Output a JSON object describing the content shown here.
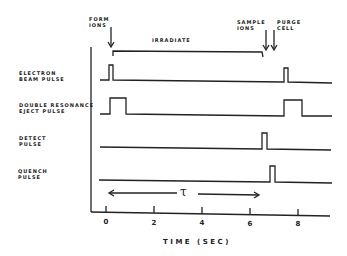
{
  "diagram": {
    "x_axis": {
      "label": "TIME (SEC)",
      "ticks": [
        "0",
        "2",
        "4",
        "6",
        "8"
      ]
    },
    "annotations": {
      "form_ions": "FORM\nIONS",
      "irradiate": "IRRADIATE",
      "sample_ions": "SAMPLE\nIONS",
      "purge_cell": "PURGE\nCELL",
      "tau": "τ"
    },
    "channels": [
      {
        "label": "ELECTRON\nBEAM PULSE",
        "pulses": [
          [
            0.1,
            0.35
          ],
          [
            7.4,
            7.6
          ]
        ]
      },
      {
        "label": "DOUBLE RESONANCE\nEJECT PULSE",
        "pulses": [
          [
            0.1,
            0.8
          ],
          [
            7.4,
            8.0
          ]
        ]
      },
      {
        "label": "DETECT\nPULSE",
        "pulses": [
          [
            6.6,
            6.75
          ]
        ]
      },
      {
        "label": "QUENCH\nPULSE",
        "pulses": [
          [
            6.9,
            7.05
          ]
        ]
      }
    ],
    "color": "#222222"
  }
}
